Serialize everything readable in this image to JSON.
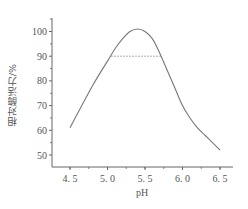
{
  "chart_data": {
    "type": "line",
    "title": "",
    "xlabel": "pH",
    "ylabel": "相对酶活力/%",
    "xlim": [
      4.3,
      6.7
    ],
    "ylim": [
      45,
      106
    ],
    "x_ticks": [
      "4.5",
      "5.0",
      "5.5",
      "6.0",
      "6.5"
    ],
    "y_ticks": [
      "50",
      "60",
      "70",
      "80",
      "90",
      "100"
    ],
    "grid": false,
    "legend": null,
    "series": [
      {
        "name": "relative activity",
        "x": [
          4.5,
          4.8,
          5.0,
          5.1,
          5.2,
          5.3,
          5.4,
          5.5,
          5.6,
          5.7,
          5.8,
          5.9,
          6.0,
          6.1,
          6.2,
          6.3,
          6.4,
          6.5
        ],
        "y": [
          61,
          78,
          88,
          93,
          97,
          100,
          101,
          100,
          97,
          91,
          84,
          77,
          70,
          65,
          61,
          58,
          55,
          52
        ]
      }
    ],
    "annotations": [
      {
        "type": "dotted-hline",
        "y": 90,
        "x_from": 5.05,
        "x_to": 5.72
      }
    ]
  }
}
